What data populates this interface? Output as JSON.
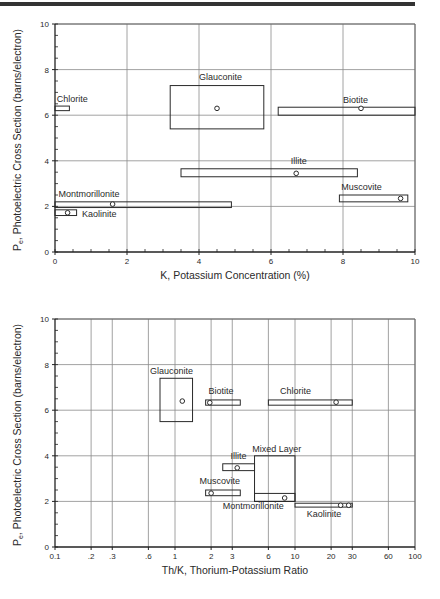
{
  "chart_data": [
    {
      "type": "scatter",
      "title": "",
      "xlabel": "K, Potassium Concentration (%)",
      "ylabel": "Pe, Photoelectric Cross Section (barns/electron)",
      "xscale": "linear",
      "xlim": [
        0,
        10
      ],
      "ylim": [
        0,
        10
      ],
      "xticks": [
        0,
        2,
        4,
        6,
        8,
        10
      ],
      "yticks": [
        0,
        2,
        4,
        6,
        8,
        10
      ],
      "grid": true,
      "minerals": [
        {
          "name": "Chlorite",
          "box": {
            "x": [
              0,
              0.4
            ],
            "y": [
              6.2,
              6.4
            ]
          },
          "points": [],
          "label_pos": [
            0.05,
            6.6
          ]
        },
        {
          "name": "Glauconite",
          "box": {
            "x": [
              3.2,
              5.8
            ],
            "y": [
              5.4,
              7.3
            ]
          },
          "points": [
            [
              4.5,
              6.3
            ]
          ],
          "label_pos": [
            4.0,
            7.55
          ]
        },
        {
          "name": "Biotite",
          "box": {
            "x": [
              6.2,
              10
            ],
            "y": [
              6.0,
              6.35
            ]
          },
          "points": [
            [
              8.5,
              6.3
            ]
          ],
          "label_pos": [
            8.0,
            6.55
          ]
        },
        {
          "name": "Illite",
          "box": {
            "x": [
              3.5,
              8.4
            ],
            "y": [
              3.3,
              3.65
            ]
          },
          "points": [
            [
              6.7,
              3.45
            ]
          ],
          "label_pos": [
            6.55,
            3.85
          ]
        },
        {
          "name": "Montmorillonite",
          "box": {
            "x": [
              0,
              4.9
            ],
            "y": [
              1.95,
              2.2
            ]
          },
          "points": [
            [
              1.6,
              2.1
            ]
          ],
          "label_pos": [
            0.1,
            2.4
          ]
        },
        {
          "name": "Kaolinite",
          "box": {
            "x": [
              0,
              0.6
            ],
            "y": [
              1.6,
              1.85
            ]
          },
          "points": [
            [
              0.35,
              1.72
            ]
          ],
          "label_pos": [
            0.75,
            1.55
          ]
        },
        {
          "name": "Muscovite",
          "box": {
            "x": [
              7.9,
              9.8
            ],
            "y": [
              2.2,
              2.5
            ]
          },
          "points": [
            [
              9.6,
              2.35
            ]
          ],
          "label_pos": [
            7.95,
            2.7
          ]
        }
      ]
    },
    {
      "type": "scatter",
      "title": "",
      "xlabel": "Th/K, Thorium-Potassium Ratio",
      "ylabel": "Pe, Photoelectric Cross Section (barns/electron)",
      "xscale": "log",
      "xlim": [
        0.1,
        100
      ],
      "ylim": [
        0,
        10
      ],
      "xticks": [
        0.1,
        0.2,
        0.3,
        0.6,
        1,
        2,
        3,
        6,
        10,
        20,
        30,
        60,
        100
      ],
      "xtick_labels": [
        "0.1",
        ".2",
        ".3",
        ".6",
        "1",
        "2",
        "3",
        "6",
        "10",
        "20",
        "30",
        "60",
        "100"
      ],
      "yticks": [
        0,
        2,
        4,
        6,
        8,
        10
      ],
      "grid": true,
      "minerals": [
        {
          "name": "Glauconite",
          "box": {
            "x": [
              0.75,
              1.4
            ],
            "y": [
              5.5,
              7.4
            ]
          },
          "points": [
            [
              1.15,
              6.4
            ]
          ],
          "label_pos": [
            0.62,
            7.6
          ]
        },
        {
          "name": "Biotite",
          "box": {
            "x": [
              1.8,
              3.5
            ],
            "y": [
              6.22,
              6.45
            ]
          },
          "points": [
            [
              1.95,
              6.33
            ]
          ],
          "label_pos": [
            1.9,
            6.7
          ]
        },
        {
          "name": "Chlorite",
          "box": {
            "x": [
              6,
              30
            ],
            "y": [
              6.22,
              6.45
            ]
          },
          "points": [
            [
              22,
              6.35
            ]
          ],
          "label_pos": [
            7.5,
            6.7
          ]
        },
        {
          "name": "Illite",
          "box": {
            "x": [
              2.5,
              4.6
            ],
            "y": [
              3.35,
              3.65
            ]
          },
          "points": [
            [
              3.3,
              3.47
            ]
          ],
          "label_pos": [
            2.9,
            3.85
          ]
        },
        {
          "name": "Mixed Layer",
          "box": {
            "x": [
              4.6,
              10
            ],
            "y": [
              2.0,
              4.0
            ]
          },
          "points": [],
          "label_pos": [
            4.4,
            4.15
          ]
        },
        {
          "name": "Montmorillonite",
          "box": {
            "x": [
              4.6,
              10
            ],
            "y": [
              2.0,
              2.35
            ]
          },
          "points": [
            [
              8.2,
              2.15
            ]
          ],
          "label_pos": [
            2.5,
            1.65
          ]
        },
        {
          "name": "Muscovite",
          "box": {
            "x": [
              1.8,
              3.5
            ],
            "y": [
              2.25,
              2.5
            ]
          },
          "points": [
            [
              2.0,
              2.36
            ]
          ],
          "label_pos": [
            1.6,
            2.75
          ]
        },
        {
          "name": "Kaolinite",
          "box": {
            "x": [
              10,
              30
            ],
            "y": [
              1.75,
              1.92
            ]
          },
          "points": [
            [
              24,
              1.83
            ],
            [
              28,
              1.83
            ]
          ],
          "label_pos": [
            12.5,
            1.3
          ]
        }
      ]
    }
  ],
  "labels": {
    "top_xlabel": "K, Potassium Concentration (%)",
    "bottom_xlabel": "Th/K, Thorium-Potassium Ratio",
    "ylabel_prefix": "P",
    "ylabel_sub": "e",
    "ylabel_rest": ", Photoelectric Cross Section (barns/electron)"
  }
}
